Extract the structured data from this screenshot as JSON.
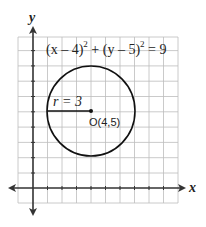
{
  "diagram": {
    "equation": {
      "part1": "(x – 4)",
      "exp1": "2",
      "plus": " + ",
      "part2": "(y – 5)",
      "exp2": "2",
      "rhs": " = 9"
    },
    "radius_label": "r = 3",
    "center_label": "O(4,5)",
    "x_axis_label": "x",
    "y_axis_label": "y",
    "center": [
      4,
      5
    ],
    "radius": 3,
    "grid": {
      "x_min": -1,
      "x_max": 10,
      "y_min": -1,
      "y_max": 10
    },
    "colors": {
      "grid": "#b8b8b8",
      "axis": "#333333",
      "circle": "#111111"
    }
  }
}
